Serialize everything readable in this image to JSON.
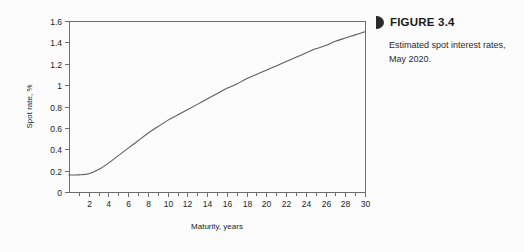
{
  "figure": {
    "bullet_icon": "half-disc-bullet-icon",
    "label": "FIGURE 3.4",
    "caption": "Estimated spot interest rates, May 2020."
  },
  "chart_data": {
    "type": "line",
    "title": "",
    "xlabel": "Maturity, years",
    "ylabel": "Spot rate, %",
    "xlim": [
      0,
      30
    ],
    "ylim": [
      0,
      1.6
    ],
    "grid": false,
    "legend": null,
    "x_major_ticks": [
      2,
      4,
      6,
      8,
      10,
      12,
      14,
      16,
      18,
      20,
      22,
      24,
      26,
      28,
      30
    ],
    "x_major_tick_labels": [
      "2",
      "4",
      "6",
      "8",
      "10",
      "12",
      "14",
      "16",
      "18",
      "20",
      "22",
      "24",
      "26",
      "28",
      "30"
    ],
    "x_minor_ticks": [
      1,
      3,
      5,
      7,
      9,
      11,
      13,
      15,
      17,
      19,
      21,
      23,
      25,
      27,
      29
    ],
    "y_ticks": [
      0,
      0.2,
      0.4,
      0.6,
      0.8,
      1,
      1.2,
      1.4,
      1.6
    ],
    "y_tick_labels": [
      "0",
      "0.2",
      "0.4",
      "0.6",
      "0.8",
      "1",
      "1.2",
      "1.4",
      "1.6"
    ],
    "series": [
      {
        "name": "Spot rate",
        "color": "#5e5e5e",
        "x": [
          0,
          1,
          2,
          3,
          4,
          5,
          6,
          7,
          8,
          9,
          10,
          11,
          12,
          13,
          14,
          15,
          16,
          17,
          18,
          19,
          20,
          21,
          22,
          23,
          24,
          25,
          26,
          27,
          28,
          29,
          30
        ],
        "y": [
          0.16,
          0.16,
          0.17,
          0.21,
          0.27,
          0.34,
          0.41,
          0.48,
          0.55,
          0.61,
          0.67,
          0.72,
          0.77,
          0.82,
          0.87,
          0.92,
          0.97,
          1.01,
          1.06,
          1.1,
          1.14,
          1.18,
          1.22,
          1.26,
          1.3,
          1.34,
          1.37,
          1.41,
          1.44,
          1.47,
          1.5
        ]
      }
    ]
  }
}
